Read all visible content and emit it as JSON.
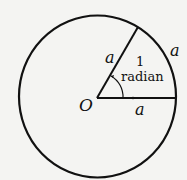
{
  "diagram": {
    "center_label": "O",
    "radius_label_slanted": "a",
    "radius_label_horizontal": "a",
    "arc_label": "a",
    "angle_value": "1",
    "angle_unit": "radian",
    "angle_radians": 1,
    "colors": {
      "ink": "#111111",
      "paper": "#f4f4f2"
    }
  }
}
